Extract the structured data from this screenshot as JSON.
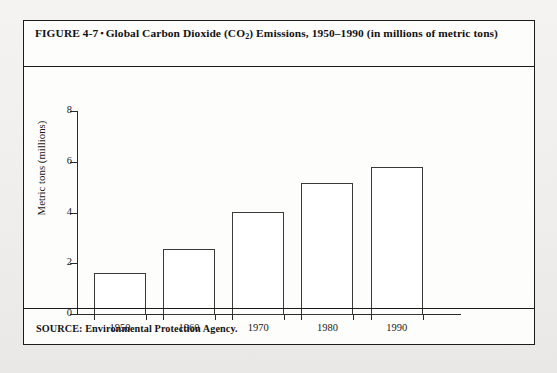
{
  "figure": {
    "label": "FIGURE 4-7",
    "bullet": "▪",
    "title_main": "Global Carbon Dioxide (CO",
    "title_sub": "2",
    "title_rest": ") Emissions, 1950–1990 (in millions of metric tons)",
    "full_title": "FIGURE 4-7 ▪ Global Carbon Dioxide (CO2) Emissions, 1950–1990 (in millions of metric tons)",
    "source": "SOURCE: Environmental Protection Agency."
  },
  "colors": {
    "ink": "#1b1b1b",
    "axis": "#2a2a2a",
    "bar_fill": "#ffffff",
    "bar_stroke": "#3a3a3a",
    "panel": "#fdfdfc",
    "page": "#f1f0ee"
  },
  "chart_data": {
    "type": "bar",
    "title": "Global Carbon Dioxide (CO2) Emissions, 1950–1990 (in millions of metric tons)",
    "categories": [
      "1950",
      "1960",
      "1970",
      "1980",
      "1990"
    ],
    "values": [
      1.65,
      2.6,
      4.05,
      5.2,
      5.85
    ],
    "xlabel": "",
    "ylabel": "Metric tons (millions)",
    "ylim": [
      0,
      8
    ],
    "yticks": [
      0,
      2,
      4,
      6,
      8
    ],
    "ytick_labels": [
      "0",
      "2",
      "4",
      "6",
      "8"
    ],
    "grid": false,
    "legend": false,
    "source": "Environmental Protection Agency"
  }
}
